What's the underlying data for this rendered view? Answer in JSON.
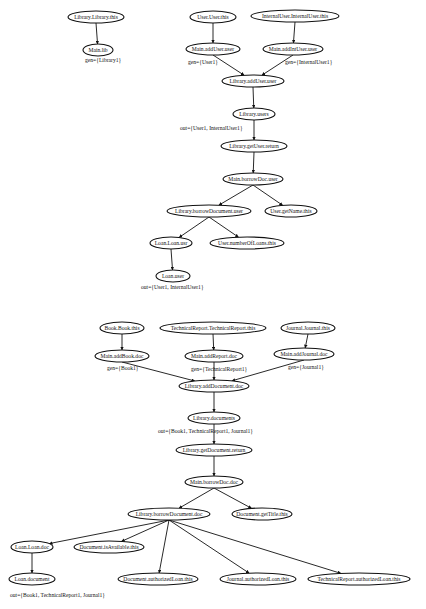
{
  "diagram": {
    "nodes": [
      {
        "id": "lib_this",
        "label": "Library.Library.this",
        "x": 96,
        "y": 17,
        "rx": 28,
        "ry": 6
      },
      {
        "id": "main_lib",
        "label": "Main.lib",
        "x": 98,
        "y": 50,
        "rx": 15,
        "ry": 6
      },
      {
        "id": "user_this",
        "label": "User.User.this",
        "x": 213,
        "y": 17,
        "rx": 23,
        "ry": 6
      },
      {
        "id": "iuser_this",
        "label": "InternalUser.InternalUser.this",
        "x": 295,
        "y": 16,
        "rx": 44,
        "ry": 6
      },
      {
        "id": "main_adduser",
        "label": "Main.addUser.user",
        "x": 213,
        "y": 49,
        "rx": 27,
        "ry": 6
      },
      {
        "id": "main_addintuser",
        "label": "Main.addIntUser.user",
        "x": 293,
        "y": 49,
        "rx": 30,
        "ry": 6
      },
      {
        "id": "lib_adduser",
        "label": "Library.addUser.user",
        "x": 253,
        "y": 81,
        "rx": 31,
        "ry": 6
      },
      {
        "id": "lib_users",
        "label": "Library.users",
        "x": 254,
        "y": 114,
        "rx": 21,
        "ry": 6
      },
      {
        "id": "lib_getuser_ret",
        "label": "Library.getUser.return",
        "x": 254,
        "y": 146,
        "rx": 33,
        "ry": 6
      },
      {
        "id": "main_borrowdoc_user",
        "label": "Main.borrowDoc.user",
        "x": 253,
        "y": 179,
        "rx": 30,
        "ry": 6
      },
      {
        "id": "lib_borrowdocument_user",
        "label": "Library.borrowDocument.user",
        "x": 209,
        "y": 211,
        "rx": 42,
        "ry": 6
      },
      {
        "id": "user_getname",
        "label": "User.getName.this",
        "x": 291,
        "y": 211,
        "rx": 26,
        "ry": 6
      },
      {
        "id": "loan_loan_usr",
        "label": "Loan.Loan.usr",
        "x": 171,
        "y": 243,
        "rx": 21,
        "ry": 6
      },
      {
        "id": "user_numloans",
        "label": "User.numberOfLoans.this",
        "x": 247,
        "y": 243,
        "rx": 37,
        "ry": 6
      },
      {
        "id": "loan_user",
        "label": "Loan.user",
        "x": 173,
        "y": 276,
        "rx": 17,
        "ry": 6
      },
      {
        "id": "book_this",
        "label": "Book.Book.this",
        "x": 122,
        "y": 328,
        "rx": 22,
        "ry": 6
      },
      {
        "id": "tr_this",
        "label": "TechnicalReport.TechnicalReport.this",
        "x": 213,
        "y": 328,
        "rx": 53,
        "ry": 6
      },
      {
        "id": "journal_this",
        "label": "Journal.Journal.this",
        "x": 308,
        "y": 328,
        "rx": 27,
        "ry": 6
      },
      {
        "id": "main_addbook",
        "label": "Main.addBook.doc",
        "x": 122,
        "y": 356,
        "rx": 27,
        "ry": 6
      },
      {
        "id": "main_addreport",
        "label": "Main.addReport.doc",
        "x": 214,
        "y": 356,
        "rx": 29,
        "ry": 6
      },
      {
        "id": "main_addjournal",
        "label": "Main.addJournal.doc",
        "x": 304,
        "y": 354,
        "rx": 30,
        "ry": 6
      },
      {
        "id": "lib_adddocument",
        "label": "Library.addDocument.doc",
        "x": 214,
        "y": 386,
        "rx": 35,
        "ry": 6
      },
      {
        "id": "lib_documents",
        "label": "Library.documents",
        "x": 214,
        "y": 418,
        "rx": 26,
        "ry": 6
      },
      {
        "id": "lib_getdoc_ret",
        "label": "Library.getDocument.return",
        "x": 214,
        "y": 450,
        "rx": 38,
        "ry": 6
      },
      {
        "id": "main_borrowdoc_doc",
        "label": "Main.borrowDoc.doc",
        "x": 214,
        "y": 482,
        "rx": 29,
        "ry": 6
      },
      {
        "id": "lib_borrowdocument_doc",
        "label": "Library.borrowDocument.doc",
        "x": 169,
        "y": 514,
        "rx": 41,
        "ry": 6
      },
      {
        "id": "doc_gettitle",
        "label": "Document.getTitle.this",
        "x": 262,
        "y": 514,
        "rx": 30,
        "ry": 6
      },
      {
        "id": "loan_loan_doc",
        "label": "Loan.Loan.doc",
        "x": 32,
        "y": 547,
        "rx": 21,
        "ry": 6
      },
      {
        "id": "doc_isavailable",
        "label": "Document.isAvailable.this",
        "x": 109,
        "y": 547,
        "rx": 35,
        "ry": 6
      },
      {
        "id": "loan_document",
        "label": "Loan.document",
        "x": 32,
        "y": 579,
        "rx": 23,
        "ry": 6
      },
      {
        "id": "doc_authloan",
        "label": "Document.authorizedLoan.this",
        "x": 158,
        "y": 579,
        "rx": 40,
        "ry": 6
      },
      {
        "id": "journal_authloan",
        "label": "Journal.authorizedLoan.this",
        "x": 258,
        "y": 579,
        "rx": 38,
        "ry": 6
      },
      {
        "id": "tr_authloan",
        "label": "TechnicalReport.authorizedLoan.this",
        "x": 359,
        "y": 579,
        "rx": 51,
        "ry": 6
      }
    ],
    "edges": [
      {
        "from": "lib_this",
        "to": "main_lib"
      },
      {
        "from": "user_this",
        "to": "main_adduser"
      },
      {
        "from": "iuser_this",
        "to": "main_addintuser"
      },
      {
        "from": "main_adduser",
        "to": "lib_adduser"
      },
      {
        "from": "main_addintuser",
        "to": "lib_adduser"
      },
      {
        "from": "lib_adduser",
        "to": "lib_users"
      },
      {
        "from": "lib_users",
        "to": "lib_getuser_ret"
      },
      {
        "from": "lib_getuser_ret",
        "to": "main_borrowdoc_user"
      },
      {
        "from": "main_borrowdoc_user",
        "to": "lib_borrowdocument_user"
      },
      {
        "from": "main_borrowdoc_user",
        "to": "user_getname"
      },
      {
        "from": "lib_borrowdocument_user",
        "to": "loan_loan_usr"
      },
      {
        "from": "lib_borrowdocument_user",
        "to": "user_numloans"
      },
      {
        "from": "loan_loan_usr",
        "to": "loan_user"
      },
      {
        "from": "book_this",
        "to": "main_addbook"
      },
      {
        "from": "tr_this",
        "to": "main_addreport"
      },
      {
        "from": "journal_this",
        "to": "main_addjournal"
      },
      {
        "from": "main_addbook",
        "to": "lib_adddocument"
      },
      {
        "from": "main_addreport",
        "to": "lib_adddocument"
      },
      {
        "from": "main_addjournal",
        "to": "lib_adddocument"
      },
      {
        "from": "lib_adddocument",
        "to": "lib_documents"
      },
      {
        "from": "lib_documents",
        "to": "lib_getdoc_ret"
      },
      {
        "from": "lib_getdoc_ret",
        "to": "main_borrowdoc_doc"
      },
      {
        "from": "main_borrowdoc_doc",
        "to": "lib_borrowdocument_doc"
      },
      {
        "from": "main_borrowdoc_doc",
        "to": "doc_gettitle"
      },
      {
        "from": "lib_borrowdocument_doc",
        "to": "loan_loan_doc"
      },
      {
        "from": "lib_borrowdocument_doc",
        "to": "doc_isavailable"
      },
      {
        "from": "lib_borrowdocument_doc",
        "to": "doc_authloan"
      },
      {
        "from": "lib_borrowdocument_doc",
        "to": "journal_authloan"
      },
      {
        "from": "lib_borrowdocument_doc",
        "to": "tr_authloan"
      },
      {
        "from": "loan_loan_doc",
        "to": "loan_document"
      }
    ],
    "annotations": [
      {
        "id": "gen_library",
        "text": "gen={Library1}",
        "x": 85,
        "y": 62
      },
      {
        "id": "gen_user",
        "text": "gen={User1}",
        "x": 188,
        "y": 64
      },
      {
        "id": "gen_internaluser",
        "text": "gen={InternalUser1}",
        "x": 285,
        "y": 64
      },
      {
        "id": "out_users",
        "text": "out={User1, InternalUser1}",
        "x": 180,
        "y": 130
      },
      {
        "id": "out_loan_user",
        "text": "out={User1, InternalUser1}",
        "x": 141,
        "y": 289
      },
      {
        "id": "gen_book",
        "text": "gen={Book1}",
        "x": 107,
        "y": 370
      },
      {
        "id": "gen_technicalreport",
        "text": "gen={TechnicalReport1}",
        "x": 191,
        "y": 371
      },
      {
        "id": "gen_journal",
        "text": "gen={Journal1}",
        "x": 288,
        "y": 369
      },
      {
        "id": "out_documents",
        "text": "out={Book1, TechnicalReport1, Journal1}",
        "x": 158,
        "y": 433
      },
      {
        "id": "out_loan_document",
        "text": "out={Book1, TechnicalReport1, Journal1}",
        "x": 10,
        "y": 597
      }
    ]
  }
}
